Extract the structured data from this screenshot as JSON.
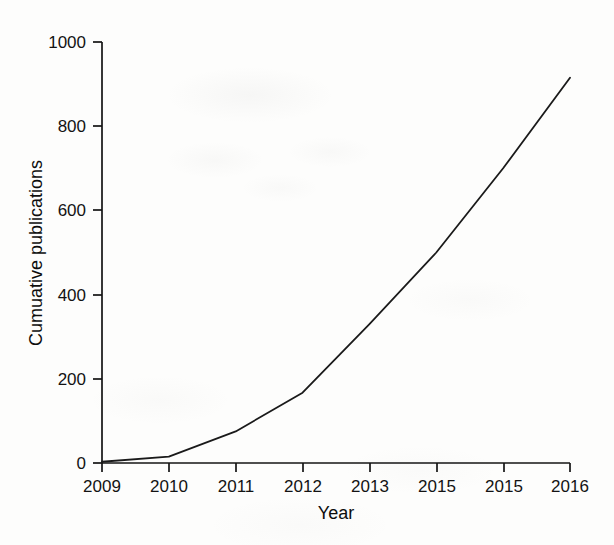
{
  "chart_data": {
    "type": "line",
    "title": "",
    "xlabel": "Year",
    "ylabel": "Cumuative publications",
    "grid": false,
    "legend": null,
    "xlim": [
      2009,
      2016
    ],
    "ylim": [
      0,
      1000
    ],
    "y_ticks": [
      0,
      200,
      400,
      600,
      800,
      1000
    ],
    "y_tick_labels": [
      "0",
      "200",
      "400",
      "600",
      "800",
      "1000"
    ],
    "x_tick_labels": [
      "2009",
      "2010",
      "2011",
      "2012",
      "2013",
      "2015",
      "2015",
      "2016"
    ],
    "x": [
      2009,
      2010,
      2011,
      2012,
      2013,
      2014,
      2015,
      2016
    ],
    "categories": [
      "2009",
      "2010",
      "2011",
      "2012",
      "2013",
      "2015",
      "2015",
      "2016"
    ],
    "values": [
      3,
      15,
      75,
      167,
      330,
      500,
      700,
      915
    ],
    "series": [
      {
        "name": "Cumuative publications",
        "values": [
          3,
          15,
          75,
          167,
          330,
          500,
          700,
          915
        ]
      }
    ],
    "line_color": "#1a1a1a",
    "background_color": "#fdfdfc"
  },
  "axes": {
    "y_title": "Cumuative publications",
    "x_title": "Year",
    "y_labels": [
      "1000",
      "800",
      "600",
      "400",
      "200",
      "0"
    ],
    "x_labels": [
      "2009",
      "2010",
      "2011",
      "2012",
      "2013",
      "2015",
      "2015",
      "2016"
    ]
  }
}
